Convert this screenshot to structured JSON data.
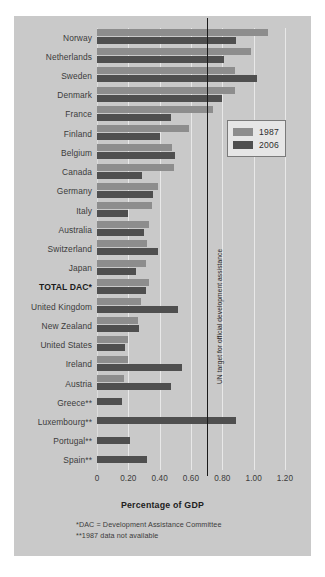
{
  "chart_data": {
    "type": "bar",
    "orientation": "horizontal",
    "title": "",
    "xlabel": "Percentage of GDP",
    "ylabel": "",
    "xlim": [
      0,
      1.2
    ],
    "xticks": [
      "0",
      "0.20",
      "0.40",
      "0.60",
      "0.80",
      "1.00",
      "1.20"
    ],
    "xtick_values": [
      0,
      0.2,
      0.4,
      0.6,
      0.8,
      1.0,
      1.2
    ],
    "grid": true,
    "legend_position": "upper right",
    "categories": [
      "Norway",
      "Netherlands",
      "Sweden",
      "Denmark",
      "France",
      "Finland",
      "Belgium",
      "Canada",
      "Germany",
      "Italy",
      "Australia",
      "Switzerland",
      "Japan",
      "TOTAL DAC*",
      "United Kingdom",
      "New Zealand",
      "United States",
      "Ireland",
      "Austria",
      "Greece**",
      "Luxembourg**",
      "Portugal**",
      "Spain**"
    ],
    "series": [
      {
        "name": "1987",
        "color": "#8d8d8d",
        "values": [
          1.09,
          0.98,
          0.88,
          0.88,
          0.74,
          0.59,
          0.48,
          0.49,
          0.39,
          0.35,
          0.33,
          0.32,
          0.31,
          0.33,
          0.28,
          0.26,
          0.2,
          0.2,
          0.17,
          null,
          null,
          null,
          null
        ]
      },
      {
        "name": "2006",
        "color": "#4f4f4f",
        "values": [
          0.89,
          0.81,
          1.02,
          0.8,
          0.47,
          0.4,
          0.5,
          0.29,
          0.36,
          0.2,
          0.3,
          0.39,
          0.25,
          0.31,
          0.52,
          0.27,
          0.18,
          0.54,
          0.47,
          0.16,
          0.89,
          0.21,
          0.32
        ]
      }
    ],
    "annotations": [
      {
        "name": "un-target",
        "value": 0.7,
        "label": "UN target for official development assistance"
      }
    ],
    "footnotes": [
      "*DAC = Development Assistance Committee",
      "**1987 data not available"
    ]
  },
  "legend": {
    "entries": [
      {
        "label": "1987",
        "color": "#8d8d8d"
      },
      {
        "label": "2006",
        "color": "#4f4f4f"
      }
    ]
  },
  "colors": {
    "background": "#c9c9c9",
    "page": "#ffffff",
    "series_1987": "#8d8d8d",
    "series_2006": "#4f4f4f",
    "gridline": "#e8e8e8",
    "target_line": "#1a1a1a",
    "text": "#3b3b3b"
  }
}
